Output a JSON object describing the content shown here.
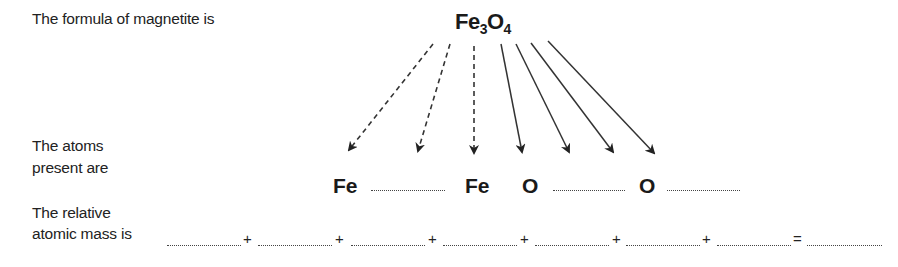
{
  "intro": {
    "label": "The formula of magnetite is",
    "formula": {
      "element1": "Fe",
      "subscript1": "3",
      "element2": "O",
      "subscript2": "4"
    }
  },
  "atoms_row": {
    "label_line1": "The atoms",
    "label_line2": "present are",
    "atoms": [
      "Fe",
      "",
      "Fe",
      "O",
      "",
      "O",
      ""
    ],
    "visible_atoms": [
      {
        "symbol": "Fe",
        "slot": 1
      },
      {
        "symbol": "Fe",
        "slot": 3
      },
      {
        "symbol": "O",
        "slot": 4
      },
      {
        "symbol": "O",
        "slot": 6
      }
    ],
    "blank_slots": [
      2,
      5,
      7
    ]
  },
  "mass_row": {
    "label_line1": "The relative",
    "label_line2": "atomic mass is",
    "operators": [
      "+",
      "+",
      "+",
      "+",
      "+",
      "+",
      "="
    ],
    "blank_count": 8
  },
  "arrows": {
    "dashed_count": 3,
    "solid_count": 4,
    "dashed_meaning": "Fe atoms (3)",
    "solid_meaning": "O atoms (4)"
  }
}
